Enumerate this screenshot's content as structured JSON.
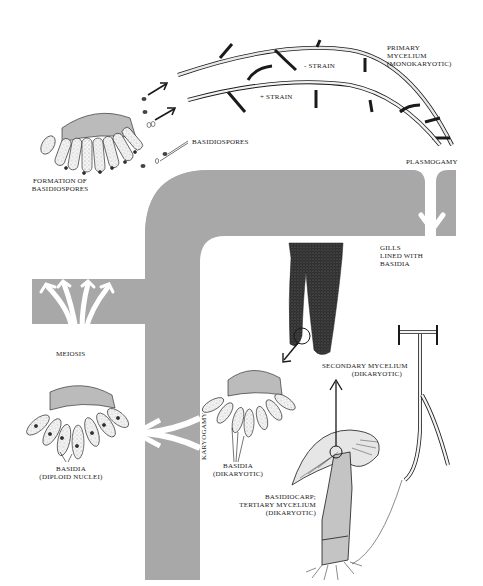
{
  "diagram": {
    "colors": {
      "band": "#a8a8a8",
      "arrow": "#ffffff",
      "ink": "#1a1a1a",
      "gill": "#3a3a3a",
      "stipple": "#d8d8d8"
    },
    "labels": {
      "primary_mycelium": "PRIMARY\nMYCELIUM\n(MONOKARYOTIC)",
      "minus_strain": "- STRAIN",
      "plus_strain": "+ STRAIN",
      "basidiospores": "BASIDIOSPORES",
      "formation": "FORMATION OF\nBASIDIOSPORES",
      "plasmogamy": "PLASMOGAMY",
      "gills": "GILLS\nLINED WITH\nBASIDIA",
      "meiosis": "MEIOSIS",
      "basidia_diploid": "BASIDIA\n(DIPLOID NUCLEI)",
      "karyogamy": "KARYOGAMY",
      "basidia_dikaryotic": "BASIDIA\n(DIKARYOTIC)",
      "secondary_mycelium": "SECONDARY MYCELIUM\n(DIKARYOTIC)",
      "basidiocarp": "BASIDIOCARP;\nTERTIARY MYCELIUM\n(DIKARYOTIC)"
    },
    "stages": [
      "Formation of basidiospores",
      "Primary mycelium (monokaryotic)",
      "Plasmogamy",
      "Secondary mycelium (dikaryotic)",
      "Basidiocarp; tertiary mycelium (dikaryotic)",
      "Gills lined with basidia",
      "Basidia (dikaryotic)",
      "Karyogamy",
      "Basidia (diploid nuclei)",
      "Meiosis"
    ]
  }
}
